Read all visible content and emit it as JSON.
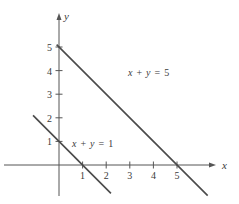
{
  "chart_data": {
    "type": "line",
    "title": "",
    "xlabel": "x",
    "ylabel": "y",
    "xlim": [
      -1.7,
      6.5
    ],
    "ylim": [
      -1.5,
      5.6
    ],
    "grid": false,
    "legend": "none",
    "x_ticks": [
      "1",
      "2",
      "3",
      "4",
      "5"
    ],
    "y_ticks": [
      "1",
      "2",
      "3",
      "4",
      "5"
    ],
    "series": [
      {
        "name": "x + y = 1",
        "label_parts": [
          "x",
          "+",
          "y",
          "=",
          "1"
        ],
        "points": [
          [
            -1.1,
            2.1
          ],
          [
            2.2,
            -1.2
          ]
        ],
        "intercepts": {
          "x": 1,
          "y": 1
        },
        "color": "#4a4a4a"
      },
      {
        "name": "x + y = 5",
        "label_parts": [
          "x",
          "+",
          "y",
          "=",
          "5"
        ],
        "points": [
          [
            -0.1,
            5.1
          ],
          [
            6.3,
            -1.3
          ]
        ],
        "intercepts": {
          "x": 5,
          "y": 5
        },
        "color": "#4a4a4a"
      }
    ],
    "annotations": [
      "x + y = 5",
      "x + y = 1"
    ]
  },
  "axes": {
    "x_label": "x",
    "y_label": "y",
    "axis_color": "#555555"
  }
}
